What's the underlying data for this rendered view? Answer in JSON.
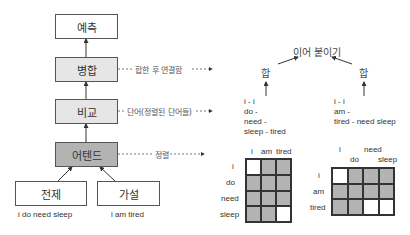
{
  "left_column": {
    "predict": "예측",
    "aggregate": "병합",
    "compare": "비교",
    "attend": "어텐드",
    "premise": "전제",
    "hypothesis": "가설",
    "premise_text": "i do need sleep",
    "hypothesis_text": "i am tired"
  },
  "annotations": {
    "aggregate_note": "합한 후 연결함",
    "compare_note": "단어(정렬된 단어들)",
    "attend_note": "정렬"
  },
  "right_side": {
    "concat": "이어 붙이기",
    "sum_left": "합",
    "sum_right": "합",
    "compare_left": "i - i\ndo -\nneed -\nsleep - tired",
    "compare_right": "i - i\nam -\ntired - need sleep"
  },
  "grid_left": {
    "col_labels": [
      "i",
      "am",
      "tired"
    ],
    "row_labels": [
      "i",
      "do",
      "need",
      "sleep"
    ],
    "cells": [
      [
        "w",
        "g",
        "g"
      ],
      [
        "g",
        "g",
        "g"
      ],
      [
        "g",
        "g",
        "g"
      ],
      [
        "g",
        "g",
        "w"
      ]
    ]
  },
  "grid_right": {
    "col_labels_top": [
      "i",
      "need"
    ],
    "col_labels_bottom": [
      "do",
      "sleep"
    ],
    "row_labels": [
      "i",
      "am",
      "tired"
    ],
    "cells": [
      [
        "w",
        "g",
        "g",
        "g"
      ],
      [
        "g",
        "g",
        "g",
        "g"
      ],
      [
        "g",
        "g",
        "w",
        "w"
      ]
    ]
  },
  "colors": {
    "dark_box": "#b3b3b3",
    "light_box": "#e6e6e6",
    "line": "#333333"
  }
}
